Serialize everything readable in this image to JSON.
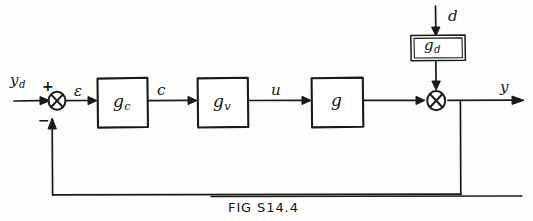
{
  "figure": {
    "caption": "FIG S14.4",
    "kind": "feedback-control-block-diagram",
    "ink_color": "#1a1a1a",
    "background_color": "#fdfdfc"
  },
  "signals": {
    "setpoint": "y",
    "setpoint_sub": "d",
    "error": "ε",
    "controller_output": "c",
    "manipulated": "u",
    "disturbance": "d",
    "output": "y"
  },
  "blocks": [
    {
      "id": "controller",
      "label": "g",
      "sub": "c"
    },
    {
      "id": "valve",
      "label": "g",
      "sub": "v"
    },
    {
      "id": "process",
      "label": "g",
      "sub": ""
    },
    {
      "id": "disturbance",
      "label": "g",
      "sub": "d"
    }
  ],
  "summing_junctions": [
    {
      "id": "error-junction",
      "signs": {
        "reference": "+",
        "feedback": "−"
      }
    },
    {
      "id": "output-junction",
      "signs": {
        "process": "",
        "disturbance": ""
      }
    }
  ]
}
